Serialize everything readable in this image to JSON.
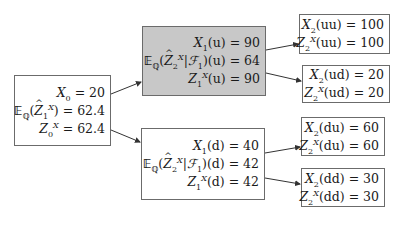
{
  "diagram": {
    "type": "binomial-tree",
    "colors": {
      "shaded_node": "#c8c8c8",
      "border": "#6b6b6b",
      "edge": "#333333"
    },
    "nodes": [
      {
        "id": "root",
        "shaded": false,
        "lines": [
          {
            "label": "X_0",
            "value": "20"
          },
          {
            "label": "E_Q(Ẑ_1^X)",
            "value": "62.4"
          },
          {
            "label": "Z_0^X",
            "value": "62.4"
          }
        ],
        "text": [
          "X",
          "0",
          "= 20",
          "E",
          "Q",
          "(",
          "Z",
          "1",
          "X",
          ") = 62.4",
          "Z",
          "0",
          "X",
          "= 62.4"
        ]
      },
      {
        "id": "u",
        "shaded": true,
        "lines": [
          {
            "label": "X_1(u)",
            "value": "90"
          },
          {
            "label": "E_Q(Ẑ_2^X|F_1)(u)",
            "value": "64"
          },
          {
            "label": "Z_1^X(u)",
            "value": "90"
          }
        ]
      },
      {
        "id": "d",
        "shaded": false,
        "lines": [
          {
            "label": "X_1(d)",
            "value": "40"
          },
          {
            "label": "E_Q(Ẑ_2^X|F_1)(d)",
            "value": "42"
          },
          {
            "label": "Z_1^X(d)",
            "value": "42"
          }
        ]
      },
      {
        "id": "uu",
        "shaded": false,
        "lines": [
          {
            "label": "X_2(uu)",
            "value": "100"
          },
          {
            "label": "Z_2^X(uu)",
            "value": "100"
          }
        ]
      },
      {
        "id": "ud",
        "shaded": false,
        "lines": [
          {
            "label": "X_2(ud)",
            "value": "20"
          },
          {
            "label": "Z_2^X(ud)",
            "value": "20"
          }
        ]
      },
      {
        "id": "du",
        "shaded": false,
        "lines": [
          {
            "label": "X_2(du)",
            "value": "60"
          },
          {
            "label": "Z_2^X(du)",
            "value": "60"
          }
        ]
      },
      {
        "id": "dd",
        "shaded": false,
        "lines": [
          {
            "label": "X_2(dd)",
            "value": "30"
          },
          {
            "label": "Z_2^X(dd)",
            "value": "30"
          }
        ]
      }
    ],
    "edges": [
      {
        "from": "root",
        "to": "u"
      },
      {
        "from": "root",
        "to": "d"
      },
      {
        "from": "u",
        "to": "uu"
      },
      {
        "from": "u",
        "to": "ud"
      },
      {
        "from": "d",
        "to": "du"
      },
      {
        "from": "d",
        "to": "dd"
      }
    ],
    "values": {
      "root": {
        "x": "20",
        "e": "62.4",
        "z": "62.4"
      },
      "u": {
        "x": "90",
        "e": "64",
        "z": "90",
        "state": "u"
      },
      "d": {
        "x": "40",
        "e": "42",
        "z": "42",
        "state": "d"
      },
      "uu": {
        "x": "100",
        "z": "100",
        "state": "uu"
      },
      "ud": {
        "x": "20",
        "z": "20",
        "state": "ud"
      },
      "du": {
        "x": "60",
        "z": "60",
        "state": "du"
      },
      "dd": {
        "x": "30",
        "z": "30",
        "state": "dd"
      }
    },
    "symbols": {
      "X": "X",
      "Z": "Z",
      "E": "𝔼",
      "Q": "ℚ",
      "F": "ℱ",
      "eq": " = "
    }
  }
}
